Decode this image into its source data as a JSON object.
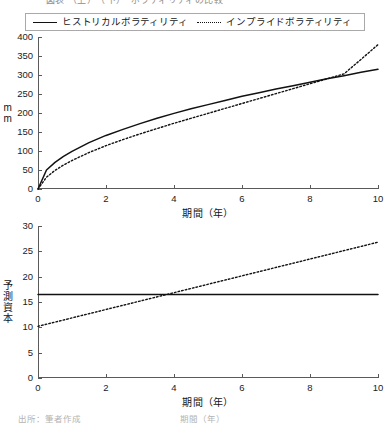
{
  "figure": {
    "top_clipped_caption": "図表 （上）　（下）　ボラティリティの比較",
    "bottom_clipped_caption": "出所：筆者作成　　　　　　　　　　　期間（年）"
  },
  "legend": {
    "entries": [
      {
        "label": "ヒストリカルボラティリティ",
        "style": "solid"
      },
      {
        "label": "インプライドボラティリティ",
        "style": "dotted"
      }
    ]
  },
  "chart_data": [
    {
      "id": "top",
      "type": "line",
      "title": "",
      "xlabel": "期間（年）",
      "ylabel": "mm",
      "xlim": [
        0,
        10
      ],
      "ylim": [
        0,
        400
      ],
      "xticks": [
        0,
        2,
        4,
        6,
        8,
        10
      ],
      "yticks": [
        0,
        50,
        100,
        150,
        200,
        250,
        300,
        350,
        400
      ],
      "xtick_labels": [
        "0",
        "2",
        "4",
        "6",
        "8",
        "10"
      ],
      "ytick_labels": [
        "0",
        "50",
        "100",
        "150",
        "200",
        "250",
        "300",
        "350",
        "400"
      ],
      "grid": false,
      "legend_position": "above-figure",
      "x": [
        0,
        0.25,
        0.5,
        0.75,
        1,
        1.5,
        2,
        2.5,
        3,
        3.5,
        4,
        4.5,
        5,
        5.5,
        6,
        6.5,
        7,
        7.5,
        8,
        8.5,
        9,
        9.5,
        10
      ],
      "series": [
        {
          "name": "ヒストリカルボラティリティ",
          "style": "solid",
          "values": [
            0,
            50,
            70,
            86,
            99,
            122,
            141,
            157,
            172,
            186,
            199,
            211,
            222,
            233,
            244,
            253,
            263,
            272,
            281,
            290,
            298,
            307,
            315
          ]
        },
        {
          "name": "インプライドボラティリティ",
          "style": "dotted",
          "values": [
            0,
            31,
            49,
            63,
            75,
            96,
            114,
            130,
            145,
            159,
            173,
            186,
            199,
            212,
            225,
            238,
            251,
            264,
            277,
            290,
            303,
            341,
            380
          ]
        }
      ]
    },
    {
      "id": "bottom",
      "type": "line",
      "title": "",
      "xlabel": "期間（年）",
      "ylabel": "予測資本",
      "xlim": [
        0,
        10
      ],
      "ylim": [
        0,
        30
      ],
      "xticks": [
        0,
        2,
        4,
        6,
        8,
        10
      ],
      "yticks": [
        0,
        5,
        10,
        15,
        20,
        25,
        30
      ],
      "xtick_labels": [
        "0",
        "2",
        "4",
        "6",
        "8",
        "10"
      ],
      "ytick_labels": [
        "0",
        "5",
        "10",
        "15",
        "20",
        "25",
        "30"
      ],
      "grid": false,
      "legend_position": "above-figure",
      "x": [
        0,
        10
      ],
      "series": [
        {
          "name": "ヒストリカルボラティリティ",
          "style": "solid",
          "values": [
            16.5,
            16.5
          ]
        },
        {
          "name": "インプライドボラティリティ",
          "style": "dotted",
          "values": [
            10.2,
            26.8
          ]
        }
      ]
    }
  ],
  "colors": {
    "line": "#111111",
    "axis": "#5a5a5a",
    "text": "#1a1a1a",
    "background": "#ffffff"
  }
}
